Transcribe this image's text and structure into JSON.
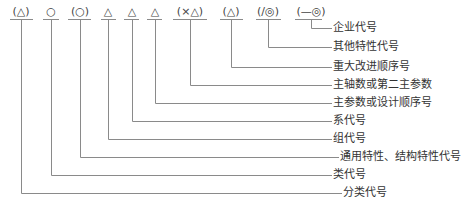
{
  "diagram": {
    "line_color": "#8a8a8a",
    "symbols": [
      {
        "text": "(△)",
        "x": 21,
        "ul": [
          10,
          33
        ]
      },
      {
        "text": "○",
        "x": 51,
        "ul": [
          43,
          59
        ]
      },
      {
        "text": "(○)",
        "x": 80,
        "ul": [
          68,
          91
        ]
      },
      {
        "text": "△",
        "x": 108,
        "ul": [
          101,
          116
        ]
      },
      {
        "text": "△",
        "x": 132,
        "ul": [
          124,
          139
        ]
      },
      {
        "text": "△",
        "x": 155,
        "ul": [
          147,
          162
        ]
      },
      {
        "text": "(×△)",
        "x": 190,
        "ul": [
          173,
          207
        ]
      },
      {
        "text": "(△)",
        "x": 231,
        "ul": [
          220,
          243
        ]
      },
      {
        "text": "(/◎)",
        "x": 268,
        "ul": [
          256,
          281
        ]
      },
      {
        "text": "(—◎)",
        "x": 311,
        "ul": [
          295,
          322
        ]
      }
    ],
    "labels": [
      {
        "text": "企业代号",
        "sym": 9,
        "y": 28,
        "x": 333
      },
      {
        "text": "其他特性代号",
        "sym": 8,
        "y": 47,
        "x": 333
      },
      {
        "text": "重大改进顺序号",
        "sym": 7,
        "y": 67,
        "x": 333
      },
      {
        "text": "主轴数或第二主参数",
        "sym": 6,
        "y": 85,
        "x": 333
      },
      {
        "text": "主参数或设计顺序号",
        "sym": 5,
        "y": 103,
        "x": 333
      },
      {
        "text": "系代号",
        "sym": 4,
        "y": 121,
        "x": 333
      },
      {
        "text": "组代号",
        "sym": 3,
        "y": 139,
        "x": 333
      },
      {
        "text": "通用特性、结构特性代号",
        "sym": 2,
        "y": 157,
        "x": 340
      },
      {
        "text": "类代号",
        "sym": 1,
        "y": 175,
        "x": 333
      },
      {
        "text": "分类代号",
        "sym": 0,
        "y": 193,
        "x": 343
      }
    ]
  }
}
